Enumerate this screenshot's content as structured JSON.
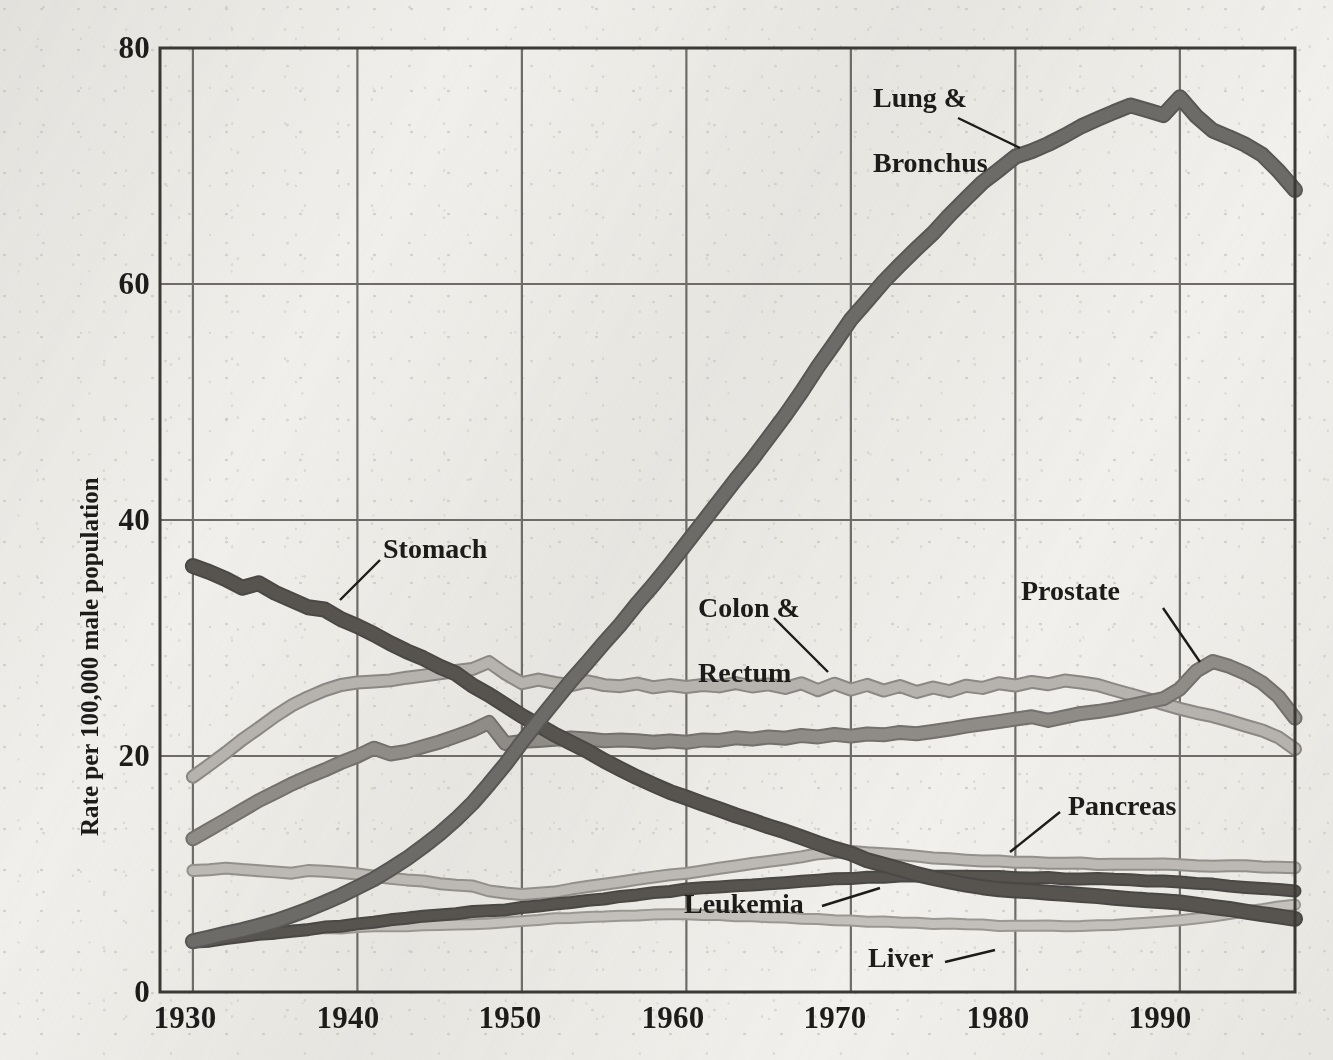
{
  "chart_data": {
    "type": "line",
    "title": "",
    "xlabel": "",
    "ylabel": "Rate per 100,000 male population",
    "xlim": [
      1928,
      1997
    ],
    "ylim": [
      0,
      80
    ],
    "grid": true,
    "legend_position": "inline-annotations",
    "y_ticks": [
      "0",
      "20",
      "40",
      "60",
      "80"
    ],
    "y_tick_values": [
      0,
      20,
      40,
      60,
      80
    ],
    "x_ticks": [
      "1930",
      "1940",
      "1950",
      "1960",
      "1970",
      "1980",
      "1990"
    ],
    "x_tick_values": [
      1930,
      1940,
      1950,
      1960,
      1970,
      1980,
      1990
    ],
    "x": [
      1930,
      1931,
      1932,
      1933,
      1934,
      1935,
      1936,
      1937,
      1938,
      1939,
      1940,
      1941,
      1942,
      1943,
      1944,
      1945,
      1946,
      1947,
      1948,
      1949,
      1950,
      1951,
      1952,
      1953,
      1954,
      1955,
      1956,
      1957,
      1958,
      1959,
      1960,
      1961,
      1962,
      1963,
      1964,
      1965,
      1966,
      1967,
      1968,
      1969,
      1970,
      1971,
      1972,
      1973,
      1974,
      1975,
      1976,
      1977,
      1978,
      1979,
      1980,
      1981,
      1982,
      1983,
      1984,
      1985,
      1986,
      1987,
      1988,
      1989,
      1990,
      1991,
      1992,
      1993,
      1994,
      1995,
      1996,
      1997
    ],
    "series": [
      {
        "name": "Lung & Bronchus",
        "color": "#595755",
        "fill": "#6d6b68",
        "values": [
          4.3,
          4.6,
          4.9,
          5.2,
          5.6,
          6.0,
          6.5,
          7.0,
          7.6,
          8.2,
          8.9,
          9.6,
          10.4,
          11.3,
          12.3,
          13.4,
          14.6,
          16.0,
          17.6,
          19.3,
          21.2,
          23.0,
          24.7,
          26.4,
          28.0,
          29.6,
          31.2,
          32.9,
          34.5,
          36.2,
          38.0,
          39.8,
          41.6,
          43.4,
          45.1,
          47.0,
          48.9,
          50.9,
          53.0,
          55.0,
          57.0,
          58.6,
          60.2,
          61.6,
          63.0,
          64.3,
          65.8,
          67.2,
          68.6,
          69.7,
          70.8,
          71.3,
          71.9,
          72.6,
          73.4,
          74.0,
          74.6,
          75.1,
          74.7,
          74.3,
          75.8,
          74.2,
          73.0,
          72.4,
          71.8,
          71.0,
          69.6,
          68.0
        ]
      },
      {
        "name": "Stomach",
        "color": "#4a4846",
        "fill": "#57544f",
        "values": [
          36.1,
          35.6,
          35.0,
          34.3,
          34.6,
          33.8,
          33.2,
          32.6,
          32.4,
          31.6,
          31.0,
          30.3,
          29.6,
          28.9,
          28.3,
          27.6,
          27.0,
          26.0,
          25.2,
          24.3,
          23.4,
          22.6,
          21.8,
          21.1,
          20.4,
          19.6,
          18.9,
          18.2,
          17.6,
          17.0,
          16.5,
          16.0,
          15.5,
          15.0,
          14.5,
          14.0,
          13.6,
          13.1,
          12.6,
          12.1,
          11.7,
          11.2,
          10.8,
          10.4,
          10.0,
          9.7,
          9.4,
          9.1,
          8.9,
          8.7,
          8.6,
          8.5,
          8.4,
          8.3,
          8.2,
          8.1,
          8.0,
          7.9,
          7.8,
          7.7,
          7.6,
          7.4,
          7.2,
          7.0,
          6.8,
          6.6,
          6.4,
          6.2
        ]
      },
      {
        "name": "Colon & Rectum",
        "color": "#8a8784",
        "fill": "#b6b3af",
        "values": [
          18.2,
          19.2,
          20.3,
          21.4,
          22.4,
          23.4,
          24.3,
          25.0,
          25.6,
          26.0,
          26.2,
          26.3,
          26.4,
          26.6,
          26.8,
          27.0,
          27.2,
          27.4,
          28.0,
          27.0,
          26.2,
          26.5,
          26.2,
          26.0,
          26.3,
          26.0,
          25.9,
          26.1,
          25.8,
          26.0,
          25.8,
          26.0,
          25.9,
          26.2,
          25.9,
          26.1,
          25.8,
          26.2,
          25.6,
          26.1,
          25.6,
          26.0,
          25.5,
          25.9,
          25.4,
          25.8,
          25.5,
          26.0,
          25.8,
          26.2,
          26.0,
          26.3,
          26.1,
          26.4,
          26.2,
          26.0,
          25.6,
          25.2,
          24.8,
          24.4,
          24.0,
          23.7,
          23.4,
          23.0,
          22.6,
          22.2,
          21.6,
          20.6
        ]
      },
      {
        "name": "Prostate",
        "color": "#73706d",
        "fill": "#8f8c88",
        "values": [
          13.0,
          13.8,
          14.6,
          15.4,
          16.2,
          16.9,
          17.6,
          18.2,
          18.8,
          19.4,
          20.0,
          20.7,
          20.2,
          20.4,
          20.8,
          21.2,
          21.7,
          22.2,
          22.8,
          21.0,
          21.2,
          21.3,
          21.4,
          21.5,
          21.4,
          21.3,
          21.4,
          21.3,
          21.2,
          21.3,
          21.2,
          21.4,
          21.3,
          21.5,
          21.4,
          21.6,
          21.5,
          21.7,
          21.6,
          21.8,
          21.7,
          21.9,
          21.8,
          22.0,
          21.9,
          22.1,
          22.3,
          22.5,
          22.7,
          22.9,
          23.1,
          23.3,
          23.0,
          23.3,
          23.6,
          23.8,
          24.0,
          24.3,
          24.6,
          24.9,
          25.7,
          27.2,
          28.0,
          27.6,
          27.0,
          26.2,
          25.0,
          23.2
        ]
      },
      {
        "name": "Pancreas",
        "color": "#93908c",
        "fill": "#bcb9b5",
        "values": [
          10.3,
          10.4,
          10.5,
          10.4,
          10.3,
          10.2,
          10.1,
          10.3,
          10.2,
          10.1,
          10.0,
          9.8,
          9.6,
          9.5,
          9.4,
          9.2,
          9.1,
          9.0,
          8.6,
          8.4,
          8.3,
          8.4,
          8.5,
          8.7,
          8.9,
          9.1,
          9.3,
          9.5,
          9.7,
          9.9,
          10.1,
          10.3,
          10.5,
          10.7,
          10.9,
          11.1,
          11.3,
          11.5,
          11.7,
          11.8,
          11.9,
          11.8,
          11.7,
          11.6,
          11.5,
          11.4,
          11.3,
          11.2,
          11.1,
          11.1,
          11.0,
          11.0,
          10.9,
          10.9,
          10.9,
          10.8,
          10.8,
          10.8,
          10.8,
          10.8,
          10.8,
          10.7,
          10.7,
          10.7,
          10.7,
          10.6,
          10.6,
          10.5
        ]
      },
      {
        "name": "Leukemia",
        "color": "#4a4846",
        "fill": "#57544f",
        "values": [
          4.2,
          4.3,
          4.5,
          4.7,
          4.9,
          5.0,
          5.2,
          5.3,
          5.5,
          5.6,
          5.8,
          5.9,
          6.1,
          6.2,
          6.4,
          6.5,
          6.6,
          6.8,
          6.9,
          7.0,
          7.2,
          7.3,
          7.5,
          7.6,
          7.8,
          7.9,
          8.1,
          8.2,
          8.4,
          8.5,
          8.7,
          8.8,
          8.9,
          9.0,
          9.1,
          9.2,
          9.3,
          9.4,
          9.5,
          9.6,
          9.6,
          9.7,
          9.7,
          9.8,
          9.8,
          9.8,
          9.8,
          9.8,
          9.8,
          9.8,
          9.7,
          9.7,
          9.7,
          9.6,
          9.6,
          9.6,
          9.5,
          9.5,
          9.4,
          9.4,
          9.3,
          9.2,
          9.1,
          9.0,
          8.9,
          8.8,
          8.7,
          8.6
        ]
      },
      {
        "name": "Liver",
        "color": "#9a9793",
        "fill": "#c3c0bc",
        "values": [
          4.5,
          4.6,
          4.8,
          4.9,
          5.0,
          5.1,
          5.2,
          5.3,
          5.4,
          5.4,
          5.5,
          5.6,
          5.6,
          5.6,
          5.7,
          5.7,
          5.7,
          5.7,
          5.8,
          5.9,
          6.0,
          6.1,
          6.2,
          6.3,
          6.4,
          6.4,
          6.5,
          6.5,
          6.6,
          6.6,
          6.6,
          6.5,
          6.5,
          6.4,
          6.4,
          6.3,
          6.3,
          6.2,
          6.2,
          6.1,
          6.1,
          6.0,
          6.0,
          5.9,
          5.9,
          5.8,
          5.8,
          5.7,
          5.7,
          5.6,
          5.6,
          5.6,
          5.6,
          5.6,
          5.6,
          5.7,
          5.7,
          5.8,
          5.9,
          6.0,
          6.1,
          6.2,
          6.4,
          6.6,
          6.8,
          7.0,
          7.2,
          7.4
        ]
      }
    ],
    "annotations": [
      {
        "label": "Lung &\nBronchus",
        "series": "Lung & Bronchus"
      },
      {
        "label": "Stomach",
        "series": "Stomach"
      },
      {
        "label": "Colon &\nRectum",
        "series": "Colon & Rectum"
      },
      {
        "label": "Prostate",
        "series": "Prostate"
      },
      {
        "label": "Pancreas",
        "series": "Pancreas"
      },
      {
        "label": "Leukemia",
        "series": "Leukemia"
      },
      {
        "label": "Liver",
        "series": "Liver"
      }
    ]
  },
  "labels": {
    "lung_bronchus_line1": "Lung &",
    "lung_bronchus_line2": "Bronchus",
    "stomach": "Stomach",
    "colon_rectum_line1": "Colon &",
    "colon_rectum_line2": "Rectum",
    "prostate": "Prostate",
    "pancreas": "Pancreas",
    "leukemia": "Leukemia",
    "liver": "Liver"
  },
  "axes": {
    "y_title": "Rate per 100,000 male population",
    "y_tick_80": "80",
    "y_tick_60": "60",
    "y_tick_40": "40",
    "y_tick_20": "20",
    "y_tick_0": "0",
    "x_tick_1930": "1930",
    "x_tick_1940": "1940",
    "x_tick_1950": "1950",
    "x_tick_1960": "1960",
    "x_tick_1970": "1970",
    "x_tick_1980": "1980",
    "x_tick_1990": "1990"
  },
  "colors": {
    "axis": "#3b3936",
    "grid": "#6e6b68",
    "text": "#1d1c1a",
    "background": "#f2f1ee"
  }
}
